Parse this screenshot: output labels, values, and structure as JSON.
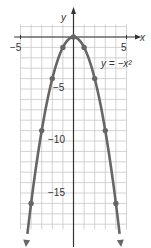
{
  "chart_data": {
    "type": "line",
    "title": "",
    "equation_label": "y = −x²",
    "xlabel": "x",
    "ylabel": "y",
    "x_tick_labels": [
      "−5",
      "5"
    ],
    "y_tick_labels": [
      "−5",
      "−10",
      "−15"
    ],
    "xlim": [
      -5,
      5
    ],
    "ylim": [
      -18,
      1
    ],
    "grid": true,
    "series": [
      {
        "name": "y = -x^2",
        "x": [
          -4,
          -3,
          -2,
          -1,
          0,
          1,
          2,
          3,
          4
        ],
        "values": [
          -16,
          -9,
          -4,
          -1,
          0,
          -1,
          -4,
          -9,
          -16
        ],
        "marker": "dot",
        "line_color": "#666666",
        "end_arrows": true
      }
    ]
  },
  "colors": {
    "curve": "#666666",
    "grid": "#c8c8c8",
    "axes": "#333333"
  }
}
